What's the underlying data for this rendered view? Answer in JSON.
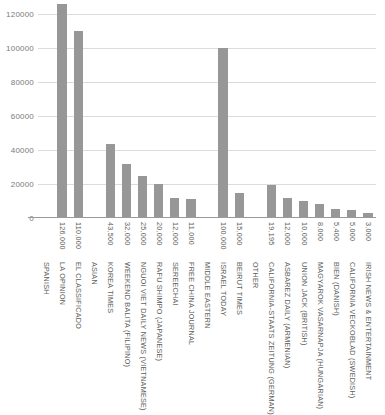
{
  "chart_data": {
    "type": "bar",
    "title": "",
    "xlabel": "",
    "ylabel": "",
    "ylim": [
      0,
      120000
    ],
    "ytick_labels": [
      "120000",
      "100000",
      "80000",
      "60000",
      "40000",
      "20000",
      "0"
    ],
    "ytick_values": [
      120000,
      100000,
      80000,
      60000,
      40000,
      20000,
      0
    ],
    "grid": true,
    "legend": "none",
    "bar_color": "#979797",
    "grid_color": "#dcdcdc",
    "axis_color": "#9a9a9a",
    "text_color": "#5e5e5e",
    "categories": [
      "SPANISH",
      "LA OPINION",
      "EL CLASSIFICADO",
      "ASIAN",
      "KOREA TIMES",
      "WEEKEND BALITA (FILIPINO)",
      "NGUOI VIET DAILY NEWS (VIETNAMESE)",
      "RAFU SHIMPO (JAPANESE)",
      "SEREECHAI",
      "FREE CHINA JOURNAL",
      "MIDDLE EASTERN",
      "ISRAEL TODAY",
      "BEIRUT TIMES",
      "OTHER",
      "CALIFORNIA-STAATS ZEITUNG (GERMAN)",
      "ASBAREZ DAILY (ARMENIAN)",
      "UNION JACK (BRITISH)",
      "MAGYAROK VASARNAPJA (HUNGARIAN)",
      "BIEN (DANISH)",
      "CALIFORNIA VECKOBLAD (SWEDISH)",
      "IRISH NEWS & ENTERTAINMENT"
    ],
    "value_labels": [
      "",
      "126,000",
      "110,000",
      "",
      "43,500",
      "32,000",
      "25,000",
      "20,000",
      "12,000",
      "11,000",
      "",
      "100,000",
      "15,000",
      "",
      "19,195",
      "12,000",
      "10,000",
      "8,000",
      "5,400",
      "5,000",
      "3,000"
    ],
    "values": [
      null,
      126000,
      110000,
      null,
      43500,
      32000,
      25000,
      20000,
      12000,
      11000,
      null,
      100000,
      15000,
      null,
      19195,
      12000,
      10000,
      8000,
      5400,
      5000,
      3000
    ],
    "is_group_header": [
      true,
      false,
      false,
      true,
      false,
      false,
      false,
      false,
      false,
      false,
      true,
      false,
      false,
      true,
      false,
      false,
      false,
      false,
      false,
      false,
      false
    ]
  }
}
